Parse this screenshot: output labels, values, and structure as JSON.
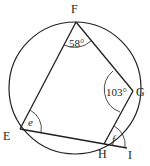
{
  "diagram": {
    "type": "cyclic-quadrilateral",
    "circle": {
      "cx": 75,
      "cy": 88,
      "r": 66
    },
    "points": {
      "F": {
        "label": "F",
        "x": 76,
        "y": 22
      },
      "G": {
        "label": "G",
        "x": 133,
        "y": 91
      },
      "H": {
        "label": "H",
        "x": 104,
        "y": 144
      },
      "E": {
        "label": "E",
        "x": 20,
        "y": 129
      },
      "I": {
        "label": "I",
        "x": 127,
        "y": 147
      }
    },
    "angles": {
      "F": {
        "label": "58°",
        "vertex": "F"
      },
      "G": {
        "label": "103°",
        "vertex": "G"
      },
      "E": {
        "label": "e",
        "vertex": "E"
      },
      "GHI": {
        "label": "f",
        "vertex": "H"
      }
    },
    "stroke_color": "#231f20"
  }
}
